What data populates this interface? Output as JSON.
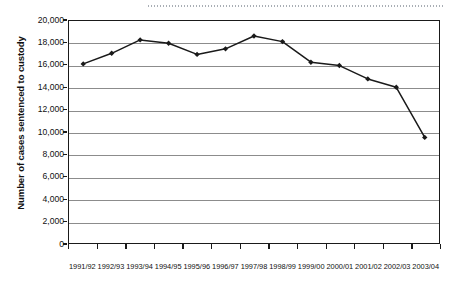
{
  "chart_data": {
    "type": "line",
    "title": "",
    "subtitle": "",
    "xlabel": "",
    "ylabel": "Number of cases sentenced to custody",
    "categories": [
      "1991/92",
      "1992/93",
      "1993/94",
      "1994/95",
      "1995/96",
      "1996/97",
      "1997/98",
      "1998/99",
      "1999/00",
      "2000/01",
      "2001/02",
      "2002/03",
      "2003/04"
    ],
    "values": [
      16150,
      17100,
      18300,
      18000,
      17000,
      17500,
      18650,
      18150,
      16300,
      16000,
      14800,
      14050,
      9550
    ],
    "series": [
      {
        "name": "Number of cases sentenced to custody",
        "values": [
          16150,
          17100,
          18300,
          18000,
          17000,
          17500,
          18650,
          18150,
          16300,
          16000,
          14800,
          14050,
          9550
        ]
      }
    ],
    "ylim": [
      0,
      20000
    ],
    "ytick_values": [
      0,
      2000,
      4000,
      6000,
      8000,
      10000,
      12000,
      14000,
      16000,
      18000,
      20000
    ],
    "ytick_labels": [
      "0",
      "2,000",
      "4,000",
      "6,000",
      "8,000",
      "10,000",
      "12,000",
      "14,000",
      "16,000",
      "18,000",
      "20,000"
    ],
    "grid": "horizontal",
    "legend": "none",
    "marker": "filled-diamond",
    "line_color": "#1a1a1a",
    "marker_color": "#1a1a1a",
    "grid_color": "#8c8c8c",
    "axis_color": "#1a1a1a",
    "background_color": "#ffffff"
  },
  "decorations": {
    "top_rule_style": "dotted"
  }
}
